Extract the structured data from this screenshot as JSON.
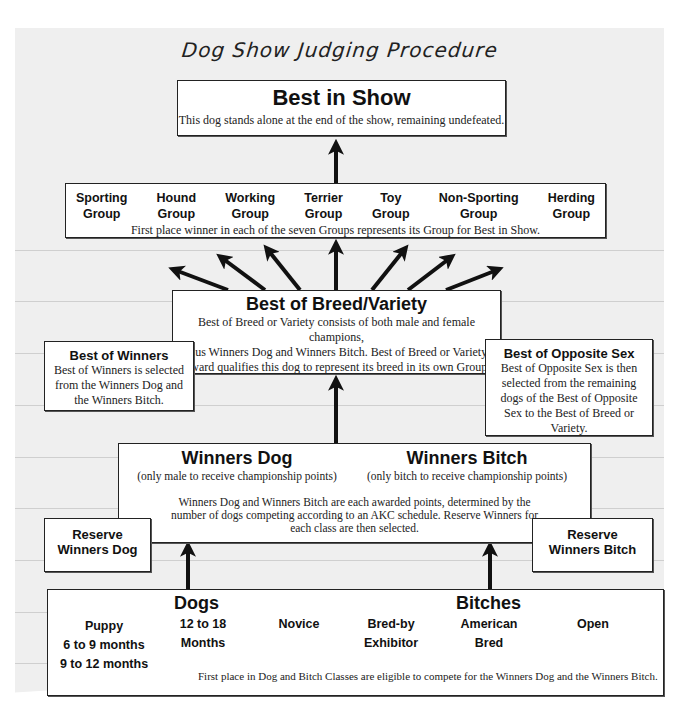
{
  "title": "Dog Show Judging Procedure",
  "best_in_show": {
    "heading": "Best in Show",
    "description": "This dog stands alone at the end of the show, remaining undefeated."
  },
  "groups": {
    "items": [
      {
        "line1": "Sporting",
        "line2": "Group"
      },
      {
        "line1": "Hound",
        "line2": "Group"
      },
      {
        "line1": "Working",
        "line2": "Group"
      },
      {
        "line1": "Terrier",
        "line2": "Group"
      },
      {
        "line1": "Toy",
        "line2": "Group"
      },
      {
        "line1": "Non-Sporting",
        "line2": "Group"
      },
      {
        "line1": "Herding",
        "line2": "Group"
      }
    ],
    "description": "First place winner in each of the seven Groups represents its Group for Best in Show."
  },
  "best_of_breed": {
    "heading": "Best of Breed/Variety",
    "lines": [
      "Best of Breed or Variety consists of both male and female champions,",
      "plus Winners Dog and Winners Bitch. Best of Breed or Variety",
      "Award qualifies this dog to represent its breed in its own Group."
    ]
  },
  "best_of_winners": {
    "heading": "Best of Winners",
    "lines": [
      "Best of Winners is selected",
      "from the Winners Dog and",
      "the Winners Bitch."
    ]
  },
  "best_of_opposite_sex": {
    "heading": "Best of Opposite Sex",
    "lines": [
      "Best of Opposite Sex is then",
      "selected from the remaining",
      "dogs of the Best of Opposite",
      "Sex to the Best of Breed or",
      "Variety."
    ]
  },
  "winners": {
    "dog_heading": "Winners Dog",
    "dog_note": "(only male to receive championship points)",
    "bitch_heading": "Winners Bitch",
    "bitch_note": "(only bitch to receive championship points)",
    "lines": [
      "Winners Dog and Winners Bitch are each awarded points, determined by the",
      "number of dogs competing according to an AKC schedule. Reserve Winners for",
      "each class are then selected."
    ]
  },
  "reserve_dog": {
    "line1": "Reserve",
    "line2": "Winners Dog"
  },
  "reserve_bitch": {
    "line1": "Reserve",
    "line2": "Winners Bitch"
  },
  "classes": {
    "dogs_heading": "Dogs",
    "bitches_heading": "Bitches",
    "puppy": {
      "line1": "Puppy",
      "line2": "6 to 9 months",
      "line3": "9 to 12 months"
    },
    "twelve": {
      "line1": "12 to 18",
      "line2": "Months"
    },
    "novice": {
      "line1": "Novice"
    },
    "bred_by": {
      "line1": "Bred-by",
      "line2": "Exhibitor"
    },
    "american": {
      "line1": "American",
      "line2": "Bred"
    },
    "open": {
      "line1": "Open"
    },
    "description": "First place in Dog and Bitch Classes are eligible to compete for the Winners Dog and the Winners Bitch."
  }
}
